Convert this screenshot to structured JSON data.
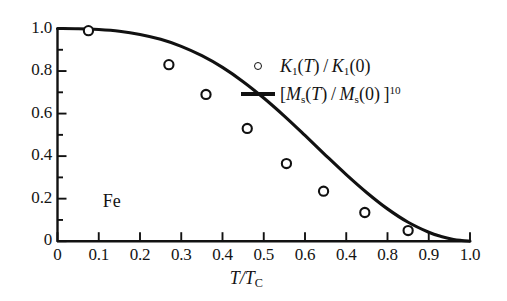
{
  "chart_data": {
    "type": "scatter",
    "title": "",
    "xlabel": "T/T_C",
    "ylabel": "",
    "xlim": [
      0,
      1.0
    ],
    "ylim": [
      0,
      1.0
    ],
    "grid": false,
    "legend_position": "upper-right",
    "annotations": [
      {
        "text": "Fe",
        "x": 0.1,
        "y": 0.18
      }
    ],
    "x_tick_labels": [
      "0",
      "0.1",
      "0.2",
      "0.3",
      "0.4",
      "0.5",
      "0.6",
      "0.4",
      "0.8",
      "0.9",
      "1.0"
    ],
    "x_tick_values": [
      0,
      0.1,
      0.2,
      0.3,
      0.4,
      0.5,
      0.6,
      0.7,
      0.8,
      0.9,
      1.0
    ],
    "y_tick_labels": [
      "0",
      "0.2",
      "0.4",
      "0.6",
      "0.8",
      "1.0"
    ],
    "y_tick_values": [
      0,
      0.2,
      0.4,
      0.6,
      0.8,
      1.0
    ],
    "series": [
      {
        "name": "K1(T)/K1(0)",
        "type": "scatter",
        "marker": "open-circle",
        "color": "#111111",
        "points": [
          {
            "x": 0.075,
            "y": 0.99
          },
          {
            "x": 0.27,
            "y": 0.83
          },
          {
            "x": 0.36,
            "y": 0.69
          },
          {
            "x": 0.46,
            "y": 0.53
          },
          {
            "x": 0.555,
            "y": 0.365
          },
          {
            "x": 0.645,
            "y": 0.235
          },
          {
            "x": 0.745,
            "y": 0.135
          },
          {
            "x": 0.85,
            "y": 0.05
          }
        ]
      },
      {
        "name": "[Ms(T)/Ms(0)]^10",
        "type": "line",
        "color": "#111111",
        "points": [
          {
            "x": 0.0,
            "y": 1.0
          },
          {
            "x": 0.05,
            "y": 0.999
          },
          {
            "x": 0.1,
            "y": 0.995
          },
          {
            "x": 0.15,
            "y": 0.987
          },
          {
            "x": 0.2,
            "y": 0.972
          },
          {
            "x": 0.25,
            "y": 0.949
          },
          {
            "x": 0.3,
            "y": 0.916
          },
          {
            "x": 0.35,
            "y": 0.872
          },
          {
            "x": 0.4,
            "y": 0.817
          },
          {
            "x": 0.45,
            "y": 0.75
          },
          {
            "x": 0.5,
            "y": 0.673
          },
          {
            "x": 0.55,
            "y": 0.588
          },
          {
            "x": 0.6,
            "y": 0.497
          },
          {
            "x": 0.65,
            "y": 0.404
          },
          {
            "x": 0.7,
            "y": 0.313
          },
          {
            "x": 0.75,
            "y": 0.228
          },
          {
            "x": 0.8,
            "y": 0.152
          },
          {
            "x": 0.85,
            "y": 0.089
          },
          {
            "x": 0.9,
            "y": 0.042
          },
          {
            "x": 0.93,
            "y": 0.022
          },
          {
            "x": 0.96,
            "y": 0.008
          },
          {
            "x": 0.98,
            "y": 0.003
          },
          {
            "x": 1.0,
            "y": 0.0
          }
        ]
      }
    ]
  },
  "legend": {
    "entries": [
      {
        "key": "open-circle",
        "symbol": "K",
        "sub": "1",
        "text_after": "(T) / K",
        "sub2": "1",
        "tail": "(0)"
      },
      {
        "key": "line",
        "open_bracket": "[",
        "symbol": "M",
        "sub": "s",
        "mid": "(T) / M",
        "sub2": "s",
        "tail": "(0) ]",
        "exponent": "10"
      }
    ]
  },
  "axis": {
    "x_title_main": "T/T",
    "x_title_sub": "C"
  },
  "annotation": {
    "sample_label": "Fe"
  }
}
